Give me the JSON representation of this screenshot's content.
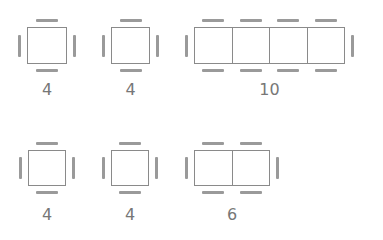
{
  "tables": [
    {
      "id": "t1",
      "label": "4",
      "seats": 4,
      "cells": 1,
      "x": 27,
      "y": 27,
      "w": 40,
      "h": 37,
      "label_x": 17,
      "label_y": 80
    },
    {
      "id": "t2",
      "label": "4",
      "seats": 4,
      "cells": 1,
      "x": 111,
      "y": 27,
      "w": 39,
      "h": 37,
      "label_x": 100,
      "label_y": 80
    },
    {
      "id": "t3",
      "label": "10",
      "seats": 10,
      "cells": 4,
      "x": 194,
      "y": 27,
      "w": 151,
      "h": 37,
      "label_x": 240,
      "label_y": 80
    },
    {
      "id": "t4",
      "label": "4",
      "seats": 4,
      "cells": 1,
      "x": 28,
      "y": 150,
      "w": 38,
      "h": 36,
      "label_x": 17,
      "label_y": 205
    },
    {
      "id": "t5",
      "label": "4",
      "seats": 4,
      "cells": 1,
      "x": 111,
      "y": 150,
      "w": 38,
      "h": 36,
      "label_x": 100,
      "label_y": 205
    },
    {
      "id": "t6",
      "label": "6",
      "seats": 6,
      "cells": 2,
      "x": 194,
      "y": 150,
      "w": 76,
      "h": 36,
      "label_x": 202,
      "label_y": 205
    }
  ],
  "colors": {
    "table_border": "#8a8a8a",
    "chair": "#9a9a9a",
    "label": "#777777"
  }
}
